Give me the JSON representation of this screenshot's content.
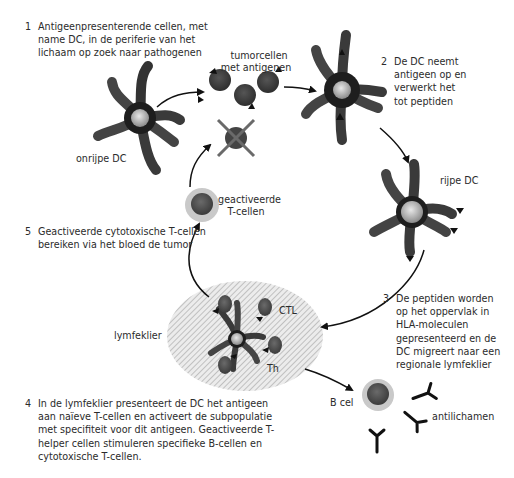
{
  "diagram": {
    "type": "cycle",
    "title": "",
    "steps": [
      {
        "number": "1",
        "lines": [
          "Antigeenpresenterende cellen, met",
          "name DC, in de periferie van het",
          "lichaam op zoek naar pathogenen"
        ]
      },
      {
        "number": "2",
        "lines": [
          "De DC neemt",
          "antigeen op en",
          "verwerkt het",
          "tot peptiden"
        ]
      },
      {
        "number": "3",
        "lines": [
          "De peptiden worden",
          "op het oppervlak in",
          "HLA-moleculen",
          "gepresenteerd en de",
          "DC migreert naar een",
          "regionale lymfeklier"
        ]
      },
      {
        "number": "4",
        "lines": [
          "In de lymfeklier presenteert de DC het antigeen",
          "aan naïeve T-cellen en activeert de subpopulatie",
          "met specifiteit voor dit antigeen. Geactiveerde T-",
          "helper cellen stimuleren specifieke B-cellen en",
          "cytotoxische T-cellen."
        ]
      },
      {
        "number": "5",
        "lines": [
          "Geactiveerde cytotoxische T-cellen",
          "bereiken via het bloed de tumor"
        ]
      }
    ],
    "labels": {
      "immature_dc": "onrijpe DC",
      "tumor_cells": [
        "tumorcellen",
        "met antigenen"
      ],
      "mature_dc": "rijpe DC",
      "activated_t_cells": [
        "geactiveerde",
        "T-cellen"
      ],
      "lymph_node": "lymfeklier",
      "ctl": "CTL",
      "th": "Th",
      "b_cell": "B cel",
      "antibodies": "antilichamen"
    },
    "nodes": [
      {
        "id": "immature-dc",
        "label": "onrijpe DC"
      },
      {
        "id": "tumor-cells",
        "label": "tumorcellen met antigenen"
      },
      {
        "id": "dc-uptake",
        "label": "De DC neemt antigeen op"
      },
      {
        "id": "mature-dc",
        "label": "rijpe DC"
      },
      {
        "id": "lymph-node",
        "label": "lymfeklier"
      },
      {
        "id": "activated-t-cells",
        "label": "geactiveerde T-cellen"
      },
      {
        "id": "b-cell",
        "label": "B cel"
      },
      {
        "id": "antibodies",
        "label": "antilichamen"
      }
    ],
    "edges": [
      {
        "from": "immature-dc",
        "to": "tumor-cells"
      },
      {
        "from": "tumor-cells",
        "to": "dc-uptake"
      },
      {
        "from": "dc-uptake",
        "to": "mature-dc"
      },
      {
        "from": "mature-dc",
        "to": "lymph-node"
      },
      {
        "from": "lymph-node",
        "to": "activated-t-cells"
      },
      {
        "from": "activated-t-cells",
        "to": "tumor-cells"
      },
      {
        "from": "lymph-node",
        "to": "b-cell"
      }
    ],
    "colors": {
      "cell_dark": "#3a3a3a",
      "cell_nucleus": "#b5b5b5",
      "halo": "#c8c8c8",
      "lymph_hatch": "#bdbdbd",
      "arrow": "#111111",
      "text": "#2b2b2b"
    }
  }
}
